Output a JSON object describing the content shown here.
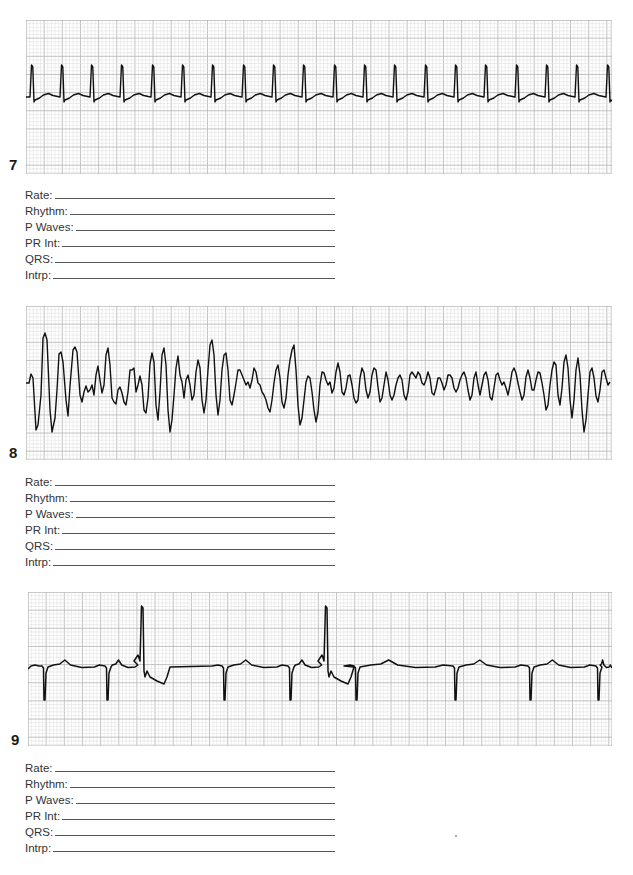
{
  "worksheet": {
    "field_labels": [
      "Rate:",
      "Rhythm:",
      "P Waves:",
      "PR Int:",
      "QRS:",
      "Intrp:"
    ],
    "colors": {
      "grid_minor": "#dcdcdc",
      "grid_major": "#b4b4b4",
      "trace": "#111111",
      "paper": "#ffffff"
    },
    "strips": [
      {
        "number": "7",
        "description": "Regular narrow-complex rhythm, ~20 QRS complexes across strip",
        "fields": {
          "rate": "",
          "rhythm": "",
          "p_waves": "",
          "pr_int": "",
          "qrs": "",
          "intrp": ""
        }
      },
      {
        "number": "8",
        "description": "Chaotic irregular wide undulating waveform, no discernible complexes",
        "fields": {
          "rate": "",
          "rhythm": "",
          "p_waves": "",
          "pr_int": "",
          "qrs": "",
          "intrp": ""
        }
      },
      {
        "number": "9",
        "description": "Regular negative QS complexes with two tall upright premature complexes",
        "fields": {
          "rate": "",
          "rhythm": "",
          "p_waves": "",
          "pr_int": "",
          "qrs": "",
          "intrp": ""
        }
      }
    ]
  },
  "chart_data": [
    {
      "type": "line",
      "title": "Strip 7",
      "xlabel": "",
      "ylabel": "",
      "grid": true,
      "beats_x_px": [
        32,
        62,
        92,
        122,
        153,
        183,
        213,
        244,
        274,
        304,
        335,
        365,
        395,
        426,
        456,
        486,
        517,
        547,
        577,
        608
      ],
      "baseline_y_px": 97,
      "r_peak_y_px": 65,
      "s_dip_y_px": 102
    },
    {
      "type": "line",
      "title": "Strip 8",
      "xlabel": "",
      "ylabel": "",
      "grid": true,
      "points_px": [
        [
          26,
          383
        ],
        [
          29,
          383
        ],
        [
          31,
          374
        ],
        [
          33,
          378
        ],
        [
          36,
          430
        ],
        [
          38,
          425
        ],
        [
          41,
          395
        ],
        [
          43,
          338
        ],
        [
          45,
          333
        ],
        [
          47,
          340
        ],
        [
          50,
          410
        ],
        [
          52,
          432
        ],
        [
          55,
          418
        ],
        [
          57,
          390
        ],
        [
          59,
          354
        ],
        [
          61,
          352
        ],
        [
          63,
          362
        ],
        [
          66,
          400
        ],
        [
          68,
          416
        ],
        [
          70,
          386
        ],
        [
          73,
          350
        ],
        [
          75,
          347
        ],
        [
          77,
          352
        ],
        [
          80,
          395
        ],
        [
          82,
          402
        ],
        [
          84,
          392
        ],
        [
          86,
          386
        ],
        [
          88,
          392
        ],
        [
          90,
          390
        ],
        [
          92,
          385
        ],
        [
          94,
          395
        ],
        [
          96,
          375
        ],
        [
          98,
          366
        ],
        [
          100,
          380
        ],
        [
          102,
          393
        ],
        [
          104,
          385
        ],
        [
          106,
          355
        ],
        [
          108,
          348
        ],
        [
          110,
          365
        ],
        [
          112,
          398
        ],
        [
          114,
          402
        ],
        [
          116,
          404
        ],
        [
          118,
          390
        ],
        [
          120,
          387
        ],
        [
          122,
          393
        ],
        [
          124,
          402
        ],
        [
          126,
          405
        ],
        [
          128,
          392
        ],
        [
          130,
          370
        ],
        [
          132,
          370
        ],
        [
          134,
          368
        ],
        [
          136,
          392
        ],
        [
          138,
          385
        ],
        [
          140,
          376
        ],
        [
          142,
          385
        ],
        [
          144,
          410
        ],
        [
          146,
          413
        ],
        [
          148,
          398
        ],
        [
          150,
          364
        ],
        [
          152,
          353
        ],
        [
          154,
          362
        ],
        [
          156,
          405
        ],
        [
          158,
          420
        ],
        [
          160,
          392
        ],
        [
          162,
          355
        ],
        [
          164,
          348
        ],
        [
          166,
          365
        ],
        [
          168,
          410
        ],
        [
          170,
          432
        ],
        [
          172,
          420
        ],
        [
          174,
          395
        ],
        [
          176,
          368
        ],
        [
          178,
          356
        ],
        [
          180,
          375
        ],
        [
          182,
          382
        ],
        [
          184,
          398
        ],
        [
          186,
          380
        ],
        [
          188,
          375
        ],
        [
          190,
          385
        ],
        [
          192,
          400
        ],
        [
          194,
          395
        ],
        [
          196,
          372
        ],
        [
          198,
          360
        ],
        [
          200,
          368
        ],
        [
          202,
          400
        ],
        [
          204,
          413
        ],
        [
          206,
          400
        ],
        [
          208,
          370
        ],
        [
          210,
          345
        ],
        [
          212,
          340
        ],
        [
          214,
          355
        ],
        [
          216,
          395
        ],
        [
          218,
          415
        ],
        [
          220,
          400
        ],
        [
          222,
          370
        ],
        [
          224,
          355
        ],
        [
          226,
          353
        ],
        [
          228,
          370
        ],
        [
          230,
          400
        ],
        [
          232,
          405
        ],
        [
          234,
          395
        ],
        [
          236,
          383
        ],
        [
          238,
          370
        ],
        [
          240,
          370
        ],
        [
          242,
          375
        ],
        [
          244,
          380
        ],
        [
          246,
          385
        ],
        [
          248,
          382
        ],
        [
          250,
          388
        ],
        [
          252,
          380
        ],
        [
          254,
          368
        ],
        [
          256,
          372
        ],
        [
          258,
          383
        ],
        [
          260,
          385
        ],
        [
          262,
          392
        ],
        [
          264,
          395
        ],
        [
          266,
          400
        ],
        [
          268,
          408
        ],
        [
          270,
          412
        ],
        [
          272,
          400
        ],
        [
          274,
          383
        ],
        [
          276,
          370
        ],
        [
          278,
          365
        ],
        [
          280,
          378
        ],
        [
          282,
          402
        ],
        [
          284,
          408
        ],
        [
          286,
          398
        ],
        [
          288,
          375
        ],
        [
          290,
          360
        ],
        [
          292,
          350
        ],
        [
          294,
          345
        ],
        [
          296,
          370
        ],
        [
          298,
          405
        ],
        [
          300,
          425
        ],
        [
          302,
          418
        ],
        [
          304,
          400
        ],
        [
          306,
          382
        ],
        [
          308,
          376
        ],
        [
          310,
          378
        ],
        [
          312,
          392
        ],
        [
          314,
          410
        ],
        [
          316,
          422
        ],
        [
          318,
          412
        ],
        [
          320,
          385
        ],
        [
          322,
          372
        ],
        [
          324,
          373
        ],
        [
          326,
          380
        ],
        [
          328,
          385
        ],
        [
          330,
          382
        ],
        [
          332,
          393
        ],
        [
          334,
          388
        ],
        [
          336,
          372
        ],
        [
          338,
          363
        ],
        [
          340,
          372
        ],
        [
          342,
          392
        ],
        [
          344,
          395
        ],
        [
          346,
          388
        ],
        [
          348,
          376
        ],
        [
          350,
          375
        ],
        [
          352,
          385
        ],
        [
          354,
          398
        ],
        [
          356,
          403
        ],
        [
          358,
          400
        ],
        [
          360,
          378
        ],
        [
          362,
          368
        ],
        [
          364,
          373
        ],
        [
          366,
          390
        ],
        [
          368,
          398
        ],
        [
          370,
          392
        ],
        [
          372,
          375
        ],
        [
          374,
          368
        ],
        [
          376,
          370
        ],
        [
          378,
          387
        ],
        [
          380,
          402
        ],
        [
          382,
          398
        ],
        [
          384,
          385
        ],
        [
          386,
          372
        ],
        [
          388,
          380
        ],
        [
          390,
          395
        ],
        [
          392,
          400
        ],
        [
          394,
          395
        ],
        [
          396,
          385
        ],
        [
          398,
          378
        ],
        [
          400,
          375
        ],
        [
          402,
          380
        ],
        [
          404,
          395
        ],
        [
          406,
          400
        ],
        [
          408,
          392
        ],
        [
          410,
          375
        ],
        [
          412,
          372
        ],
        [
          414,
          375
        ],
        [
          416,
          378
        ],
        [
          418,
          372
        ],
        [
          420,
          375
        ],
        [
          422,
          383
        ],
        [
          424,
          385
        ],
        [
          426,
          380
        ],
        [
          428,
          372
        ],
        [
          430,
          378
        ],
        [
          432,
          393
        ],
        [
          434,
          395
        ],
        [
          436,
          388
        ],
        [
          438,
          378
        ],
        [
          440,
          378
        ],
        [
          442,
          383
        ],
        [
          444,
          390
        ],
        [
          446,
          385
        ],
        [
          448,
          375
        ],
        [
          450,
          375
        ],
        [
          452,
          378
        ],
        [
          454,
          388
        ],
        [
          456,
          392
        ],
        [
          458,
          388
        ],
        [
          460,
          380
        ],
        [
          462,
          375
        ],
        [
          464,
          372
        ],
        [
          466,
          378
        ],
        [
          468,
          390
        ],
        [
          470,
          400
        ],
        [
          472,
          395
        ],
        [
          474,
          378
        ],
        [
          476,
          372
        ],
        [
          478,
          385
        ],
        [
          480,
          395
        ],
        [
          482,
          385
        ],
        [
          484,
          375
        ],
        [
          486,
          372
        ],
        [
          488,
          380
        ],
        [
          490,
          397
        ],
        [
          492,
          400
        ],
        [
          494,
          388
        ],
        [
          496,
          375
        ],
        [
          498,
          373
        ],
        [
          500,
          380
        ],
        [
          502,
          385
        ],
        [
          504,
          382
        ],
        [
          506,
          388
        ],
        [
          508,
          395
        ],
        [
          510,
          385
        ],
        [
          512,
          372
        ],
        [
          514,
          368
        ],
        [
          516,
          373
        ],
        [
          518,
          383
        ],
        [
          520,
          392
        ],
        [
          522,
          400
        ],
        [
          524,
          395
        ],
        [
          526,
          377
        ],
        [
          528,
          370
        ],
        [
          530,
          378
        ],
        [
          532,
          390
        ],
        [
          534,
          390
        ],
        [
          536,
          380
        ],
        [
          538,
          372
        ],
        [
          540,
          373
        ],
        [
          542,
          383
        ],
        [
          544,
          395
        ],
        [
          546,
          410
        ],
        [
          548,
          405
        ],
        [
          550,
          385
        ],
        [
          552,
          370
        ],
        [
          554,
          362
        ],
        [
          556,
          365
        ],
        [
          558,
          395
        ],
        [
          560,
          405
        ],
        [
          562,
          388
        ],
        [
          564,
          362
        ],
        [
          566,
          355
        ],
        [
          568,
          368
        ],
        [
          570,
          400
        ],
        [
          572,
          418
        ],
        [
          574,
          400
        ],
        [
          576,
          370
        ],
        [
          578,
          358
        ],
        [
          580,
          375
        ],
        [
          582,
          410
        ],
        [
          584,
          432
        ],
        [
          586,
          420
        ],
        [
          588,
          395
        ],
        [
          590,
          372
        ],
        [
          592,
          368
        ],
        [
          594,
          378
        ],
        [
          596,
          396
        ],
        [
          598,
          402
        ],
        [
          600,
          390
        ],
        [
          602,
          372
        ],
        [
          604,
          370
        ],
        [
          606,
          378
        ],
        [
          608,
          385
        ],
        [
          610,
          382
        ]
      ]
    },
    {
      "type": "line",
      "title": "Strip 9",
      "xlabel": "",
      "ylabel": "",
      "grid": true,
      "qs_x_px": [
        44,
        107,
        224,
        290,
        356,
        455,
        530,
        598
      ],
      "pvc_x_px": [
        142,
        326
      ],
      "baseline_y_px": 667,
      "qs_dip_y_px": 700,
      "pvc_peak_y_px": 606
    }
  ]
}
